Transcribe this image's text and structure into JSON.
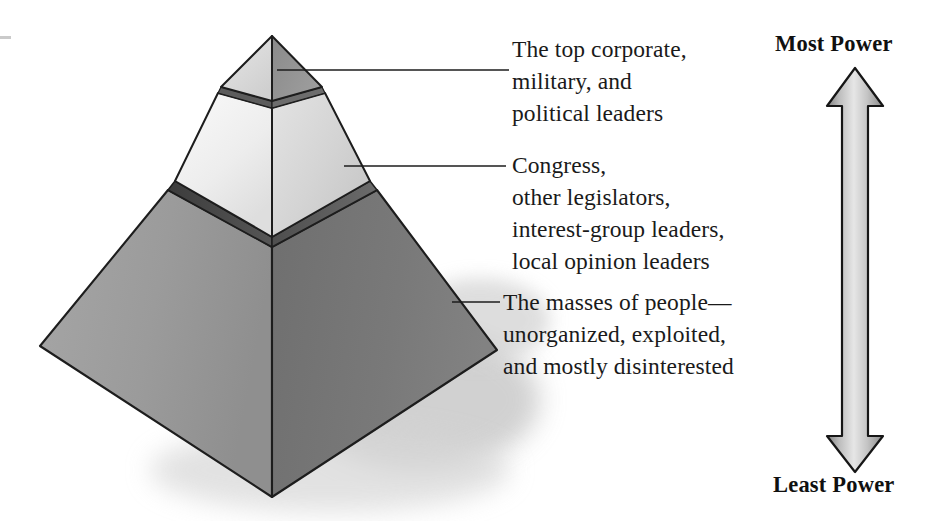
{
  "figure": {
    "diagram_type": "three-tier power pyramid",
    "background_color": "#ffffff"
  },
  "pyramid": {
    "tiers": [
      {
        "id": "apex",
        "rank": 1,
        "name": "top-tier",
        "left_face_color": "#d9d9d9",
        "right_face_color": "#8e8e8e",
        "label_lines": [
          "The top corporate,",
          "military, and",
          "political leaders"
        ]
      },
      {
        "id": "middle",
        "rank": 2,
        "name": "middle-tier",
        "left_face_color": "#efefef",
        "right_face_color": "#d2d2d2",
        "band_color": "#4a4a4a",
        "label_lines": [
          "Congress,",
          "other legislators,",
          "interest-group leaders,",
          "local opinion leaders"
        ]
      },
      {
        "id": "base",
        "rank": 3,
        "name": "base-tier",
        "left_face_color": "#9a9a9a",
        "right_face_color": "#777777",
        "label_lines": [
          "The masses of people—",
          "unorganized, exploited,",
          "and mostly disinterested"
        ]
      }
    ],
    "outline_color": "#1d1d1d",
    "shadow_color": "#cfcfcf"
  },
  "callouts": {
    "top": {
      "lines": [
        "The top corporate,",
        "military, and",
        "political leaders"
      ],
      "text": "The top corporate,\nmilitary, and\npolitical leaders"
    },
    "middle": {
      "lines": [
        "Congress,",
        "other legislators,",
        "interest-group leaders,",
        "local opinion leaders"
      ],
      "text": "Congress,\nother legislators,\ninterest-group leaders,\nlocal opinion leaders"
    },
    "bottom": {
      "lines": [
        "The masses of people—",
        "unorganized, exploited,",
        "and mostly disinterested"
      ],
      "text": "The masses of people—\nunorganized, exploited,\nand mostly disinterested"
    }
  },
  "power_scale": {
    "top_label": "Most Power",
    "bottom_label": "Least Power",
    "arrow": {
      "direction": "double-headed vertical",
      "fill_light": "#e2e2e2",
      "fill_dark": "#8d8d8d",
      "outline_color": "#161616"
    }
  }
}
